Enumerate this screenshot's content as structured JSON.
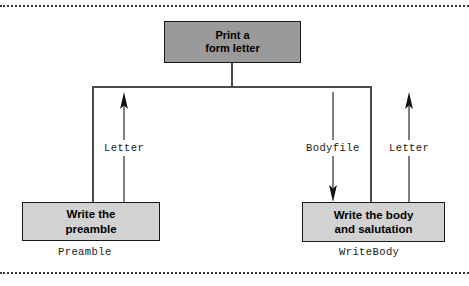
{
  "diagram": {
    "type": "data-flow-diagram",
    "colors": {
      "root_fill": "#9a9a9a",
      "leaf_fill": "#d2d2d2",
      "box_border": "#1a1a1a",
      "line": "#4a4a4a",
      "text": "#000000",
      "page_rule": "#3a3a3a"
    },
    "nodes": [
      {
        "id": "root",
        "label": "Print a\nform letter",
        "caption": "",
        "fill": "#9a9a9a"
      },
      {
        "id": "preamble",
        "label": "Write the\npreamble",
        "caption": "Preamble",
        "fill": "#d2d2d2"
      },
      {
        "id": "writebody",
        "label": "Write the body\nand salutation",
        "caption": "WriteBody",
        "fill": "#d2d2d2"
      }
    ],
    "flows": [
      {
        "id": "letter-left",
        "label": "Letter",
        "direction": "up",
        "from": "preamble",
        "to": "root"
      },
      {
        "id": "bodyfile",
        "label": "Bodyfile",
        "direction": "down",
        "from": "root",
        "to": "writebody"
      },
      {
        "id": "letter-right",
        "label": "Letter",
        "direction": "up",
        "from": "writebody",
        "to": "root"
      }
    ]
  }
}
